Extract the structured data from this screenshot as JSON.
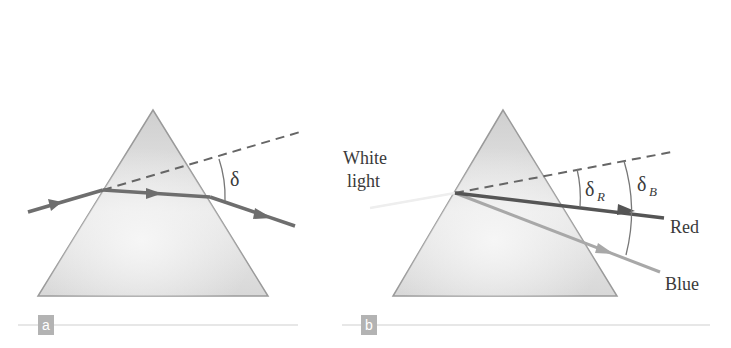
{
  "figure": {
    "panel_a": {
      "label": "a",
      "angle_label": "δ"
    },
    "panel_b": {
      "label": "b",
      "incident_label_line1": "White",
      "incident_label_line2": "light",
      "angle_red_label": "δ",
      "angle_red_sub": "R",
      "angle_blue_label": "δ",
      "angle_blue_sub": "B",
      "red_ray_label": "Red",
      "blue_ray_label": "Blue"
    },
    "colors": {
      "prism_fill": "#d6d6d6",
      "prism_edge": "#9a9a9a",
      "ray": "#6e6e6e",
      "red_ray": "#555555",
      "blue_ray": "#a8a8a8",
      "dashed": "#666666",
      "label_box": "#b3b3b3",
      "rule": "#d0d0d0"
    }
  }
}
